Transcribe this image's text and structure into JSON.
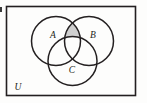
{
  "figure": {
    "name": "three-set-venn-diagram",
    "background_color": "#fdfdfc",
    "stroke_color": "#231f20",
    "shade_color": "#cfcfcf",
    "shade_stroke_color": "#231f20"
  },
  "universal_set": {
    "label": "U",
    "label_x": 18,
    "label_y": 90,
    "rect": {
      "x": 6.5,
      "y": 6.5,
      "width": 129,
      "height": 89
    },
    "stroke_width": 1.6
  },
  "circles": [
    {
      "id": "A",
      "label": "A",
      "cx": 56,
      "cy": 41,
      "r": 24.5,
      "label_x": 53,
      "label_y": 38
    },
    {
      "id": "B",
      "label": "B",
      "cx": 89,
      "cy": 41,
      "r": 24.5,
      "label_x": 93,
      "label_y": 38
    },
    {
      "id": "C",
      "label": "C",
      "cx": 72.5,
      "cy": 61,
      "r": 24.5,
      "label_x": 72,
      "label_y": 73
    }
  ],
  "shaded_region": {
    "id": "A-and-B-minus-C",
    "description": "Region inside both A and B but outside C",
    "fill": "#cfcfcf"
  },
  "labels": {
    "set_a": "A",
    "set_b": "B",
    "set_c": "C",
    "universe": "U"
  },
  "typography": {
    "set_label_size": "9.5px",
    "universe_label_size": "9.5px"
  }
}
